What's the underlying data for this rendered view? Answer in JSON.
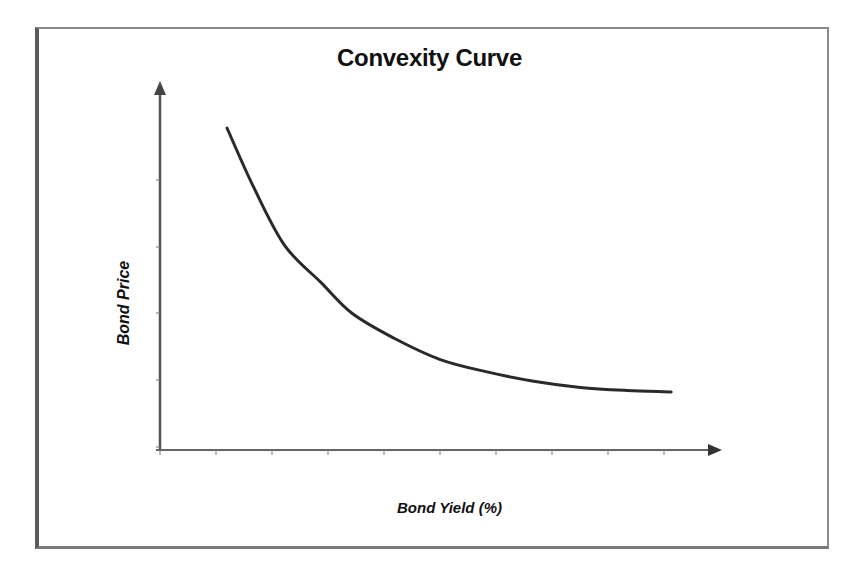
{
  "chart_data": {
    "type": "line",
    "title": "Convexity Curve",
    "xlabel": "Bond Yield (%)",
    "ylabel": "Bond Price",
    "x_tick_labels": [],
    "y_tick_labels": [],
    "grid": false,
    "legend": null,
    "axes": {
      "x_ticks_count": 10,
      "y_ticks_count": 4,
      "arrows": true
    },
    "series": [
      {
        "name": "Convexity Curve",
        "color": "#2a2a2a",
        "note": "values in relative units (0-100 scale) read from pixel positions; no numeric ticks shown",
        "x": [
          12.9,
          18,
          24,
          31,
          37,
          45,
          54,
          63,
          72,
          81,
          90,
          98.5
        ],
        "y": [
          100,
          81,
          62,
          50,
          40,
          32,
          25,
          21,
          18,
          16,
          15,
          14.5
        ]
      }
    ]
  }
}
